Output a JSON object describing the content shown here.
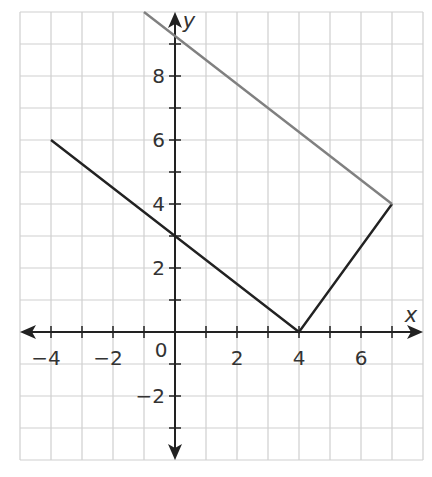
{
  "chart_data": {
    "type": "line",
    "title": "",
    "xlabel": "x",
    "ylabel": "y",
    "xlim": [
      -5,
      8
    ],
    "ylim": [
      -4,
      10
    ],
    "grid": true,
    "x_ticks": [
      -4,
      -2,
      0,
      2,
      4,
      6
    ],
    "y_ticks": [
      -2,
      2,
      4,
      6,
      8
    ],
    "origin_label": "0",
    "series": [
      {
        "name": "black-path",
        "color": "#222222",
        "points": [
          [
            -4,
            6
          ],
          [
            0,
            3
          ],
          [
            4,
            0
          ],
          [
            7,
            4
          ]
        ]
      },
      {
        "name": "gray-segment",
        "color": "#808080",
        "points": [
          [
            -1,
            10
          ],
          [
            7,
            4
          ]
        ]
      }
    ]
  },
  "colors": {
    "grid": "#cfcfcf",
    "axis": "#222222",
    "black_line": "#222222",
    "gray_line": "#808080"
  }
}
